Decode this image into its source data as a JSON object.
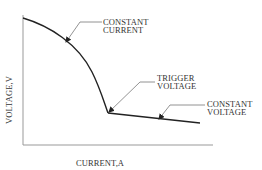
{
  "diagram": {
    "type": "voltage-current characteristic curve",
    "axes": {
      "y_label": "VOLTAGE,V",
      "x_label": "CURRENT,A"
    },
    "annotations": [
      {
        "id": "constant-current",
        "lines": [
          "CONSTANT",
          "CURRENT"
        ]
      },
      {
        "id": "trigger-voltage",
        "lines": [
          "TRIGGER",
          "VOLTAGE"
        ]
      },
      {
        "id": "constant-voltage",
        "lines": [
          "CONSTANT",
          "VOLTAGE"
        ]
      }
    ],
    "colors": {
      "curve": "#222222",
      "axis": "#999999",
      "leader": "#777777",
      "text": "#333333"
    }
  }
}
